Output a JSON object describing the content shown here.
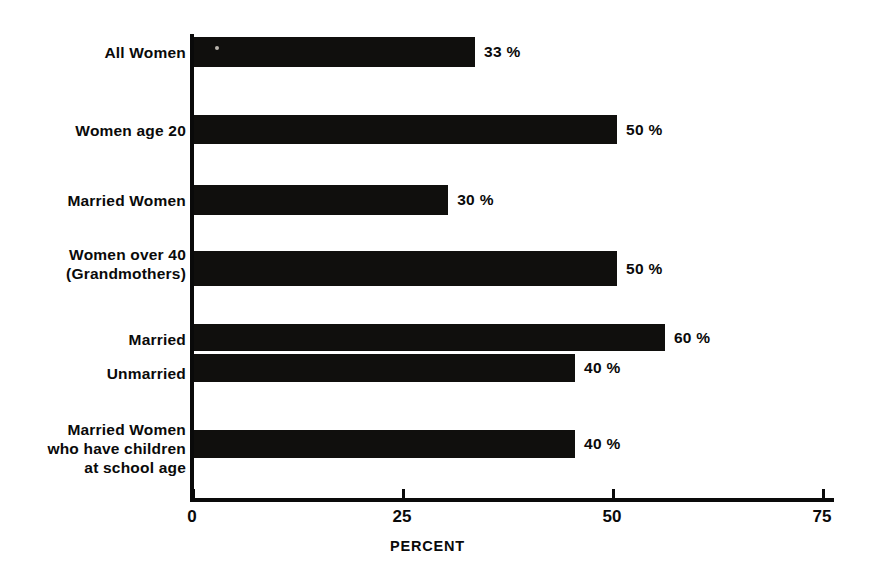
{
  "chart_data": {
    "type": "bar",
    "orientation": "horizontal",
    "title": "",
    "xlabel": "PERCENT",
    "ylabel": "",
    "xlim": [
      0,
      78
    ],
    "xticks": [
      0,
      25,
      50,
      75
    ],
    "xtick_labels": [
      "0",
      "25",
      "50",
      "75"
    ],
    "grid": false,
    "legend": false,
    "bar_color": "#100f0d",
    "background_color": "#ffffff",
    "categories": [
      "All Women",
      "Women age 20",
      "Married Women",
      "Women over 40\n(Grandmothers)",
      "Married",
      "Unmarried",
      "Married Women\nwho have children\nat school age"
    ],
    "values": [
      33,
      50,
      30,
      50,
      60,
      40,
      40
    ],
    "value_labels": [
      "33 %",
      "50 %",
      "30 %",
      "50 %",
      "60 %",
      "40 %",
      "40 %"
    ],
    "bars": [
      {
        "label": "All Women",
        "value": 33,
        "value_label": "33 %",
        "drawn_extent": 33.7,
        "top": 9,
        "height": 30
      },
      {
        "label": "Women age 20",
        "value": 50,
        "value_label": "50 %",
        "drawn_extent": 50.6,
        "top": 87,
        "height": 29
      },
      {
        "label": "Married Women",
        "value": 30,
        "value_label": "30 %",
        "drawn_extent": 30.5,
        "top": 157,
        "height": 30
      },
      {
        "label": "Women over 40\n(Grandmothers)",
        "value": 50,
        "value_label": "50 %",
        "drawn_extent": 50.6,
        "top": 223,
        "height": 35
      },
      {
        "label": "Married",
        "value": 60,
        "value_label": "60 %",
        "drawn_extent": 56.3,
        "top": 296,
        "height": 27
      },
      {
        "label": "Unmarried",
        "value": 40,
        "value_label": "40 %",
        "drawn_extent": 45.6,
        "top": 326,
        "height": 28
      },
      {
        "label": "Married Women\nwho have children\nat school age",
        "value": 40,
        "value_label": "40 %",
        "drawn_extent": 45.6,
        "top": 402,
        "height": 28
      }
    ]
  },
  "axis": {
    "x_title": "PERCENT",
    "ticks": [
      {
        "label": "0",
        "value": 0
      },
      {
        "label": "25",
        "value": 25
      },
      {
        "label": "50",
        "value": 50
      },
      {
        "label": "75",
        "value": 75
      }
    ]
  }
}
